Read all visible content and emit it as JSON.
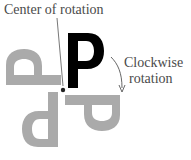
{
  "diagram": {
    "labels": {
      "center": "Center of rotation",
      "rotation_line1": "Clockwise",
      "rotation_line2": "rotation"
    },
    "letter": "P",
    "colors": {
      "original": "#000000",
      "rotated": "#aaaaaa",
      "text": "#4a4a4a",
      "arrow": "#555555"
    },
    "rotations_deg": [
      0,
      90,
      180,
      270
    ],
    "center_point": [
      63,
      90
    ]
  }
}
